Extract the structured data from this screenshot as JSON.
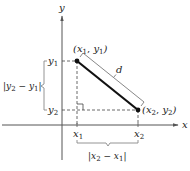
{
  "axes": {
    "x_label": "x",
    "y_label": "y"
  },
  "points": [
    {
      "name": "P1",
      "label_open": "(",
      "label_x": "x",
      "label_x_sub": "1",
      "label_sep": ", ",
      "label_y": "y",
      "label_y_sub": "1",
      "label_close": ")"
    },
    {
      "name": "P2",
      "label_open": "(",
      "label_x": "x",
      "label_x_sub": "2",
      "label_sep": ", ",
      "label_y": "y",
      "label_y_sub": "2",
      "label_close": ")"
    }
  ],
  "ticks": {
    "x1": {
      "base": "x",
      "sub": "1"
    },
    "x2": {
      "base": "x",
      "sub": "2"
    },
    "y1": {
      "base": "y",
      "sub": "1"
    },
    "y2": {
      "base": "y",
      "sub": "2"
    }
  },
  "distance_label": "d",
  "vertical_diff": {
    "bar_l": "|",
    "a": "y",
    "a_sub": "2",
    "minus": " − ",
    "b": "y",
    "b_sub": "1",
    "bar_r": "|"
  },
  "horizontal_diff": {
    "bar_l": "|",
    "a": "x",
    "a_sub": "2",
    "minus": " − ",
    "b": "x",
    "b_sub": "1",
    "bar_r": "|"
  },
  "colors": {
    "axis": "#555555",
    "segment": "#111111",
    "dashed": "#444444",
    "bracket": "#888888",
    "text": "#222222"
  }
}
